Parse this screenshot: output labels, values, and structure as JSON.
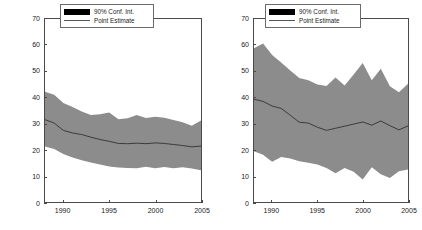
{
  "panels": [
    {
      "title": "Attainment Counties",
      "ylabel_prefix": "Mean PM",
      "ylabel_sub": "10",
      "ylabel_mid": " Concentrations in μg/m",
      "ylabel_sup": "3",
      "legend": {
        "band_label": "90% Conf. Int.",
        "line_label": "Point Estimate"
      }
    },
    {
      "title": "Non-Attainment Counties",
      "ylabel_prefix": "Mean PM",
      "ylabel_sub": "10",
      "ylabel_mid": " Concentrations in μg/m",
      "ylabel_sup": "3",
      "legend": {
        "band_label": "90% Conf. Int.",
        "line_label": "Point Estimate"
      }
    }
  ],
  "chart_data": [
    {
      "type": "area",
      "title": "Attainment Counties",
      "xlabel": "",
      "ylabel": "Mean PM10 Concentrations in μg/m3",
      "xlim": [
        1988,
        2005
      ],
      "ylim": [
        0,
        70
      ],
      "yticks": [
        0,
        10,
        20,
        30,
        40,
        50,
        60,
        70
      ],
      "xticks": [
        1990,
        1995,
        2000,
        2005
      ],
      "grid": false,
      "legend_position": "top-right",
      "band_color": "#8c8c8c",
      "line_color": "#303030",
      "x": [
        1988,
        1989,
        1990,
        1991,
        1992,
        1993,
        1994,
        1995,
        1996,
        1997,
        1998,
        1999,
        2000,
        2001,
        2002,
        2003,
        2004,
        2005
      ],
      "series": [
        {
          "name": "Point Estimate",
          "values": [
            31.5,
            30.2,
            27.4,
            26.4,
            25.8,
            24.8,
            23.9,
            23.2,
            22.4,
            22.3,
            22.5,
            22.3,
            22.6,
            22.4,
            22.0,
            21.6,
            21.1,
            21.4
          ]
        },
        {
          "name": "90% Conf. Int. upper",
          "values": [
            42.2,
            41.0,
            37.9,
            36.3,
            34.6,
            33.3,
            33.6,
            34.2,
            31.7,
            32.0,
            33.3,
            32.1,
            32.6,
            32.2,
            31.4,
            30.5,
            29.2,
            31.2
          ]
        },
        {
          "name": "90% Conf. Int. lower",
          "values": [
            21.2,
            20.3,
            18.4,
            17.0,
            16.0,
            15.1,
            14.3,
            13.6,
            13.2,
            13.0,
            12.9,
            13.5,
            12.9,
            13.4,
            12.9,
            13.3,
            12.8,
            12.1
          ]
        }
      ]
    },
    {
      "type": "area",
      "title": "Non-Attainment Counties",
      "xlabel": "",
      "ylabel": "Mean PM10 Concentrations in μg/m3",
      "xlim": [
        1988,
        2005
      ],
      "ylim": [
        0,
        70
      ],
      "yticks": [
        0,
        10,
        20,
        30,
        40,
        50,
        60,
        70
      ],
      "xticks": [
        1990,
        1995,
        2000,
        2005
      ],
      "grid": false,
      "legend_position": "top-right",
      "band_color": "#8c8c8c",
      "line_color": "#303030",
      "x": [
        1988,
        1989,
        1990,
        1991,
        1992,
        1993,
        1994,
        1995,
        1996,
        1997,
        1998,
        1999,
        2000,
        2001,
        2002,
        2003,
        2004,
        2005
      ],
      "series": [
        {
          "name": "Point Estimate",
          "values": [
            39.3,
            38.5,
            36.7,
            35.8,
            33.2,
            30.5,
            30.2,
            28.6,
            27.4,
            28.2,
            29.0,
            29.8,
            30.6,
            29.4,
            31.0,
            29.2,
            27.6,
            29.1
          ]
        },
        {
          "name": "90% Conf. Int. upper",
          "values": [
            58.8,
            60.6,
            56.2,
            53.4,
            50.3,
            47.4,
            46.6,
            44.9,
            44.4,
            47.6,
            44.6,
            48.8,
            53.2,
            46.6,
            51.0,
            44.3,
            42.0,
            45.2
          ]
        },
        {
          "name": "90% Conf. Int. lower",
          "values": [
            19.4,
            18.1,
            15.4,
            17.2,
            16.6,
            15.6,
            15.0,
            14.3,
            13.0,
            11.0,
            13.0,
            11.6,
            8.6,
            13.3,
            10.6,
            9.2,
            11.8,
            12.4
          ]
        }
      ]
    }
  ]
}
